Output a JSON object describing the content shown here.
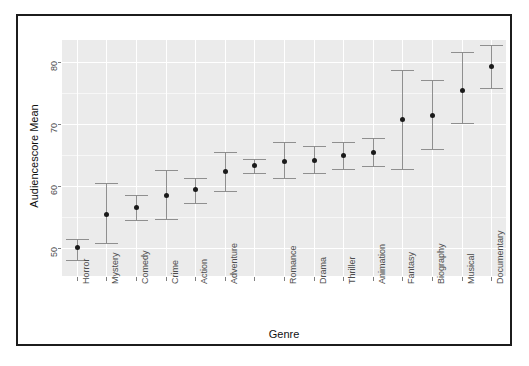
{
  "figure": {
    "ghost_title": "",
    "xlabel": "Genre",
    "ylabel": "Audiencescore Mean"
  },
  "chart_data": {
    "type": "scatter",
    "title": "",
    "xlabel": "Genre",
    "ylabel": "Audiencescore Mean",
    "ylim": [
      45.5,
      83.5
    ],
    "yticks": [
      50,
      60,
      70,
      80
    ],
    "grid": true,
    "legend": null,
    "error_bars": "vertical, capped (95% CI)",
    "categories": [
      "Horror",
      "Mystery",
      "Comedy",
      "Crime",
      "Action",
      "Adventure",
      "",
      "Romance",
      "Drama",
      "Thriller",
      "Animation",
      "Fantasy",
      "Biography",
      "Musical",
      "Documentary"
    ],
    "values": [
      50.2,
      55.5,
      56.6,
      58.5,
      59.5,
      62.4,
      63.3,
      64.0,
      64.2,
      65.0,
      65.4,
      70.8,
      71.5,
      75.5,
      79.3
    ],
    "ci_low": [
      48.1,
      50.8,
      54.5,
      54.6,
      57.3,
      59.2,
      62.1,
      61.3,
      62.1,
      62.8,
      63.2,
      62.8,
      66.0,
      70.2,
      75.8
    ],
    "ci_high": [
      51.5,
      60.4,
      58.6,
      62.5,
      61.3,
      65.4,
      64.4,
      67.0,
      66.5,
      67.1,
      67.7,
      78.6,
      77.1,
      81.5,
      82.7
    ],
    "tick_labels_rotated": true,
    "unlabeled_tick_index": 6
  }
}
